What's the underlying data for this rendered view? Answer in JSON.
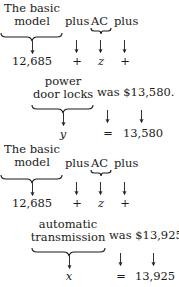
{
  "blocks": [
    {
      "id": "block1",
      "phrase": {
        "subject_line1": "The basic",
        "subject_line2": "model",
        "connector1": "plus",
        "item": "AC",
        "connector2": "plus"
      },
      "translation": {
        "subject_value": "12,685",
        "connector1_symbol": "+",
        "item_variable": "z",
        "connector2_symbol": "+"
      }
    },
    {
      "id": "block2",
      "phrase": {
        "item_line1": "power",
        "item_line2": "door locks",
        "verb_total": "was $13,580."
      },
      "translation": {
        "item_variable": "y",
        "verb_symbol": "=",
        "total_value": "13,580"
      }
    },
    {
      "id": "block3",
      "phrase": {
        "subject_line1": "The basic",
        "subject_line2": "model",
        "connector1": "plus",
        "item": "AC",
        "connector2": "plus"
      },
      "translation": {
        "subject_value": "12,685",
        "connector1_symbol": "+",
        "item_variable": "z",
        "connector2_symbol": "+"
      }
    },
    {
      "id": "block4",
      "phrase": {
        "item_line1": "automatic",
        "item_line2": "transmission",
        "verb_total": "was $13,925."
      },
      "translation": {
        "item_variable": "x",
        "verb_symbol": "=",
        "total_value": "13,925"
      }
    }
  ]
}
